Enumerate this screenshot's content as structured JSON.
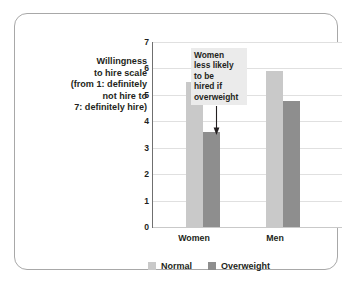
{
  "caption": {
    "lines": [
      "Willingness",
      "to hire scale",
      "(from 1: definitely",
      "not hire to",
      "7: definitely hire)"
    ]
  },
  "annotation": {
    "lines": [
      "Women",
      "less likely",
      "to be",
      "hired if",
      "overweight"
    ],
    "arrow_icon": "down-arrow-icon"
  },
  "colors": {
    "normal": "#c9c9c9",
    "overweight": "#8e8e8e",
    "grid": "#e0e0e0",
    "axis": "#6f6f6f",
    "frame": "#a8a8a8",
    "annotation_bg": "#ebebeb",
    "text": "#231f20"
  },
  "chart_data": {
    "type": "bar",
    "title": "",
    "xlabel": "",
    "ylabel": "Willingness to hire scale (from 1: definitely not hire to 7: definitely hire)",
    "categories": [
      "Women",
      "Men"
    ],
    "series": [
      {
        "name": "Normal",
        "values": [
          5.5,
          5.9
        ]
      },
      {
        "name": "Overweight",
        "values": [
          3.6,
          4.75
        ]
      }
    ],
    "ylim": [
      0,
      7
    ],
    "yticks": [
      0,
      1,
      2,
      3,
      4,
      5,
      6,
      7
    ],
    "ytick_labels": [
      "0",
      "1",
      "2",
      "3",
      "4",
      "5",
      "6",
      "7"
    ],
    "grid": true,
    "legend_position": "bottom",
    "annotations": [
      {
        "text": "Women less likely to be hired if overweight",
        "points_to": {
          "category": "Women",
          "series": "Overweight"
        }
      }
    ]
  }
}
